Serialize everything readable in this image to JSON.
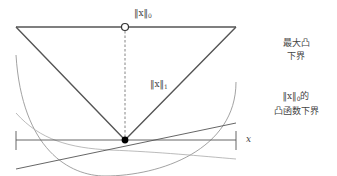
{
  "diagram": {
    "title": "",
    "labels": {
      "l0_norm_top": "‖x‖",
      "l0_norm_top_sub": "0",
      "l1_norm": "‖x‖",
      "l1_norm_sub": "1",
      "axis_x": "x",
      "max_convex_lower_bound_line1": "最大凸",
      "max_convex_lower_bound_line2": "下界",
      "l0_convex_lower_bounds_line1_norm": "‖x‖",
      "l0_convex_lower_bounds_line1_sub": "0",
      "l0_convex_lower_bounds_line1_suffix": "的",
      "l0_convex_lower_bounds_line2": "凸函数下界"
    },
    "colors": {
      "main_line": "#555555",
      "curve": "#888888",
      "light_curve": "#aaaaaa",
      "point_fill": "#000000"
    },
    "elements": [
      {
        "type": "line",
        "name": "l0-top-line",
        "from": [
          16,
          27
        ],
        "to": [
          236,
          27
        ]
      },
      {
        "type": "open-circle",
        "name": "l0-value-at-zero",
        "at": [
          125,
          27
        ]
      },
      {
        "type": "polyline",
        "name": "l1-norm-v",
        "points": [
          [
            16,
            27
          ],
          [
            125,
            140
          ],
          [
            236,
            27
          ]
        ]
      },
      {
        "type": "dashed-line",
        "name": "jump-dashed-line",
        "from": [
          125,
          27
        ],
        "to": [
          125,
          140
        ]
      },
      {
        "type": "filled-circle",
        "name": "origin-point",
        "at": [
          125,
          140
        ]
      },
      {
        "type": "axis",
        "name": "x-axis",
        "from": [
          16,
          140
        ],
        "to": [
          236,
          140
        ]
      },
      {
        "type": "curve",
        "name": "convex-lower-bound-parabola"
      },
      {
        "type": "curve",
        "name": "convex-lower-bound-decay"
      },
      {
        "type": "line",
        "name": "convex-lower-bound-linear",
        "from": [
          16,
          169
        ],
        "to": [
          236,
          123
        ]
      }
    ]
  }
}
